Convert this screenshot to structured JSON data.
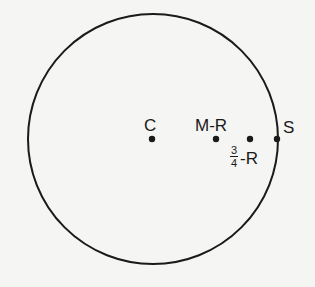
{
  "diagram": {
    "type": "circle-with-points",
    "circle": {
      "cx": 153,
      "cy": 139,
      "r": 125,
      "stroke": "#1a1a1a",
      "stroke_width": 2
    },
    "points": [
      {
        "id": "C",
        "label": "C",
        "x": 152,
        "y": 139
      },
      {
        "id": "M-R",
        "label": "M-R",
        "x": 216,
        "y": 139
      },
      {
        "id": "3/4-R",
        "label_numerator": "3",
        "label_denominator": "4",
        "label_suffix": "-R",
        "x": 250,
        "y": 139
      },
      {
        "id": "S",
        "label": "S",
        "x": 277,
        "y": 139
      }
    ],
    "colors": {
      "ink": "#1a1a1a",
      "background": "#f5f5f3"
    }
  }
}
